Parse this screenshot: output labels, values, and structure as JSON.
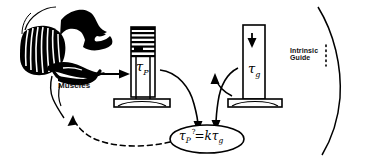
{
  "figure": {
    "background_color": "#ffffff",
    "ink_color": "#000000",
    "width": 366,
    "height": 168
  },
  "labels": {
    "muscles": "Muscles",
    "intrinsic_guide_line1": "Intrinsic",
    "intrinsic_guide_line2": "Guide",
    "tau_p": "τ",
    "tau_p_sub": "P",
    "tau_g": "τ",
    "tau_g_sub": "g",
    "equation_tau": "τ",
    "equation_tau_sub": "P",
    "equation_question": "?",
    "equation_equals": "=",
    "equation_k": "k",
    "equation_tau2": "τ",
    "equation_tau2_sub": "g"
  },
  "elements": {
    "head_illustration": "sagittal-head-tongue-muscle-drawing",
    "left_cylinder": "graduated-cylinder-tau-p",
    "right_cylinder": "plain-cylinder-tau-g",
    "down_arrow_icon": "down-arrow-in-right-cylinder",
    "muscles_arrow_icon": "up-arrow-to-muscles",
    "tongue_to_cylinder_arrow": "right-arrow-tongue-to-cylinder",
    "feedback_arrow": "dashed-curved-arrow-equation-to-muscles",
    "left_curved_arrow": "curved-arrow-left-cylinder-to-equation",
    "right_curved_arrow": "curved-arrow-right-cylinder-to-equation",
    "equation_ellipse": "equation-ellipse-outline",
    "right_border_curve": "right-enclosing-curve",
    "dotted_guide_line": "vertical-dotted-line"
  }
}
